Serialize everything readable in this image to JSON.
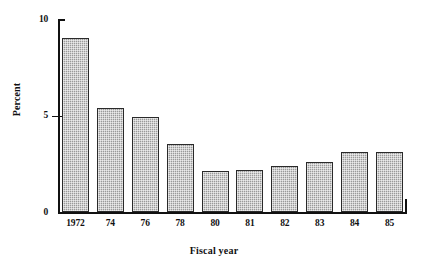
{
  "chart_data": {
    "type": "bar",
    "title": "",
    "xlabel": "Fiscal year",
    "ylabel": "Percent",
    "categories": [
      "1972",
      "74",
      "76",
      "78",
      "80",
      "81",
      "82",
      "83",
      "84",
      "85"
    ],
    "values": [
      9.0,
      5.4,
      4.9,
      3.5,
      2.1,
      2.2,
      2.4,
      2.6,
      3.1,
      3.1
    ],
    "ylim": [
      0,
      10
    ],
    "yticks": [
      0,
      5,
      10
    ],
    "yticklabels": [
      "0",
      "5",
      "10"
    ],
    "grid": false,
    "legend": null,
    "bar_color": "#9a9a9a",
    "bar_edge_color": "#2a2a2a",
    "axis_color": "#111111",
    "background": "#ffffff"
  }
}
